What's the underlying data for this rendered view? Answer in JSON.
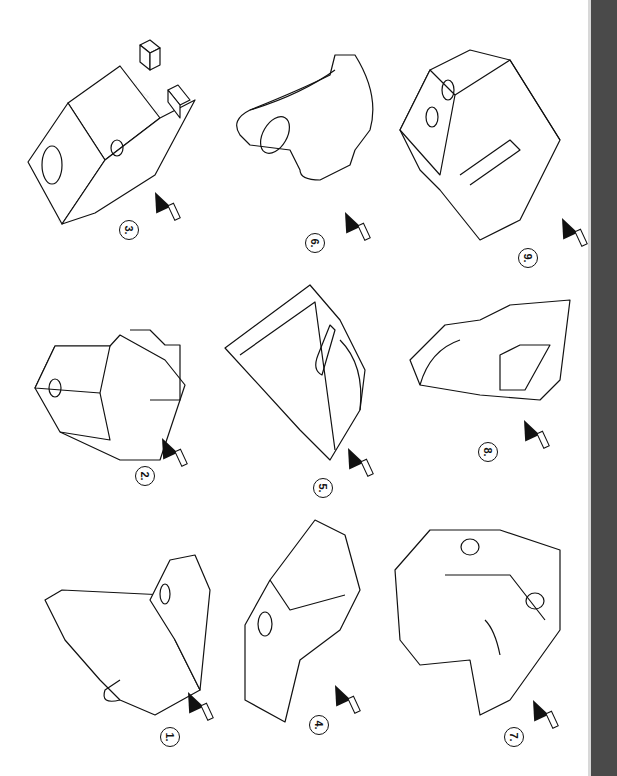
{
  "page": {
    "orientation": "rotated-90",
    "figures": [
      {
        "id": 1,
        "label": "1.",
        "description": "L-bracket with rounded lug and hole"
      },
      {
        "id": 2,
        "label": "2.",
        "description": "Stepped cross block with hole"
      },
      {
        "id": 3,
        "label": "3.",
        "description": "Block with holes and small cube projections"
      },
      {
        "id": 4,
        "label": "4.",
        "description": "Tapered block with hole and notches"
      },
      {
        "id": 5,
        "label": "5.",
        "description": "Triangular frame with slot and curved edge"
      },
      {
        "id": 6,
        "label": "6.",
        "description": "Curved hook plate with elliptical hole"
      },
      {
        "id": 7,
        "label": "7.",
        "description": "Stepped block with two holes and groove"
      },
      {
        "id": 8,
        "label": "8.",
        "description": "Plate with semicircular cutout and rectangular pocket"
      },
      {
        "id": 9,
        "label": "9.",
        "description": "Hexagonal block with two holes and diagonal rib"
      }
    ],
    "arrow_icon": "viewing-direction-arrow",
    "colors": {
      "line": "#111111",
      "grid": "#cfcfcf",
      "edge_strip": "#4a4a4a"
    }
  }
}
